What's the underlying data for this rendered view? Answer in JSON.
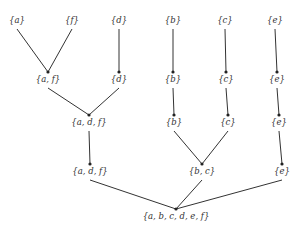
{
  "diagram": {
    "type": "merge-tree",
    "nodes": [
      {
        "id": "n_a",
        "label": "{a}"
      },
      {
        "id": "n_f",
        "label": "{f}"
      },
      {
        "id": "n_d1",
        "label": "{d}"
      },
      {
        "id": "n_b1",
        "label": "{b}"
      },
      {
        "id": "n_c1",
        "label": "{c}"
      },
      {
        "id": "n_e1",
        "label": "{e}"
      },
      {
        "id": "n_af",
        "label": "{a, f}"
      },
      {
        "id": "n_d2",
        "label": "{d}"
      },
      {
        "id": "n_b2",
        "label": "{b}"
      },
      {
        "id": "n_c2",
        "label": "{c}"
      },
      {
        "id": "n_e2",
        "label": "{e}"
      },
      {
        "id": "n_adf1",
        "label": "{a, d, f}"
      },
      {
        "id": "n_b3",
        "label": "{b}"
      },
      {
        "id": "n_c3",
        "label": "{c}"
      },
      {
        "id": "n_e3",
        "label": "{e}"
      },
      {
        "id": "n_adf2",
        "label": "{a, d, f}"
      },
      {
        "id": "n_bc",
        "label": "{b, c}"
      },
      {
        "id": "n_e4",
        "label": "{e}"
      },
      {
        "id": "n_root",
        "label": "{a, b, c, d, e, f}"
      }
    ],
    "edges": [
      [
        "n_a",
        "n_af"
      ],
      [
        "n_f",
        "n_af"
      ],
      [
        "n_d1",
        "n_d2"
      ],
      [
        "n_b1",
        "n_b2"
      ],
      [
        "n_c1",
        "n_c2"
      ],
      [
        "n_e1",
        "n_e2"
      ],
      [
        "n_af",
        "n_adf1"
      ],
      [
        "n_d2",
        "n_adf1"
      ],
      [
        "n_b2",
        "n_b3"
      ],
      [
        "n_c2",
        "n_c3"
      ],
      [
        "n_e2",
        "n_e3"
      ],
      [
        "n_adf1",
        "n_adf2"
      ],
      [
        "n_b3",
        "n_bc"
      ],
      [
        "n_c3",
        "n_bc"
      ],
      [
        "n_e3",
        "n_e4"
      ],
      [
        "n_adf2",
        "n_root"
      ],
      [
        "n_bc",
        "n_root"
      ],
      [
        "n_e4",
        "n_root"
      ]
    ]
  }
}
